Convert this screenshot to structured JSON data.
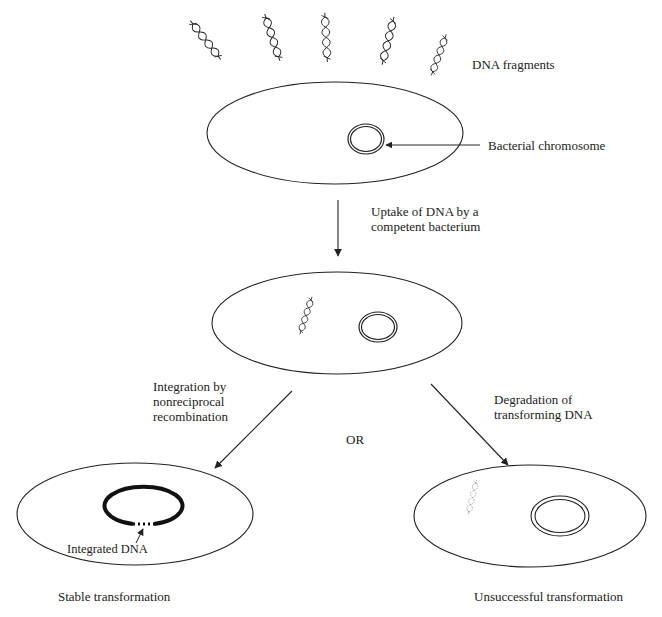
{
  "diagram": {
    "labels": {
      "dna_fragments": "DNA fragments",
      "bacterial_chromosome": "Bacterial chromosome",
      "uptake": "Uptake of DNA by a\ncompetent bacterium",
      "integration": "Integration by\nnonreciprocal\nrecombination",
      "or": "OR",
      "degradation": "Degradation of\ntransforming DNA",
      "integrated_dna": "Integrated DNA",
      "stable": "Stable transformation",
      "unsuccessful": "Unsuccessful transformation"
    },
    "colors": {
      "stroke": "#222222",
      "degraded_dna": "#888888",
      "background": "#ffffff"
    },
    "nodes": [
      {
        "id": "cell-before-uptake",
        "label": "Bacterium with bacterial chromosome"
      },
      {
        "id": "cell-after-uptake",
        "label": "Competent bacterium with taken-up DNA"
      },
      {
        "id": "cell-stable",
        "label": "Stable transformation"
      },
      {
        "id": "cell-unsuccessful",
        "label": "Unsuccessful transformation"
      }
    ],
    "edges": [
      {
        "from": "cell-before-uptake",
        "to": "cell-after-uptake",
        "label": "Uptake of DNA by a competent bacterium"
      },
      {
        "from": "cell-after-uptake",
        "to": "cell-stable",
        "label": "Integration by nonreciprocal recombination"
      },
      {
        "from": "cell-after-uptake",
        "to": "cell-unsuccessful",
        "label": "Degradation of transforming DNA"
      }
    ]
  }
}
